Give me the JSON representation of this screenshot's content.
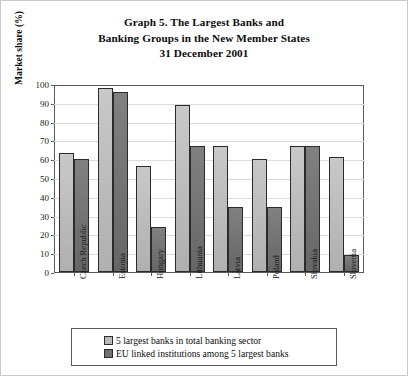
{
  "chart_data": {
    "type": "bar",
    "title": "Graph 5. The Largest Banks and Banking Groups in the New Member States 31 December 2001",
    "title_lines": [
      "Graph 5. The Largest Banks and",
      "Banking Groups in the New Member States",
      "31 December 2001"
    ],
    "xlabel": "",
    "ylabel": "Market share (%)",
    "ylim": [
      0,
      100
    ],
    "ytick_labels": [
      "0",
      "10",
      "20",
      "30",
      "40",
      "50",
      "60",
      "70",
      "80",
      "90",
      "100"
    ],
    "ytick_values": [
      0,
      10,
      20,
      30,
      40,
      50,
      60,
      70,
      80,
      90,
      100
    ],
    "grid": true,
    "legend_position": "bottom",
    "categories": [
      "Czech Republic",
      "Estonia",
      "Hungary",
      "Lithuania",
      "Latvia",
      "Poland",
      "Slovakia",
      "Slovenia"
    ],
    "series": [
      {
        "name": "5 largest banks in total banking sector",
        "color": "#b9b9b9",
        "values": [
          64,
          99,
          57,
          90,
          68,
          61,
          68,
          62
        ]
      },
      {
        "name": "EU linked institutions among 5 largest banks",
        "color": "#6f6f6f",
        "values": [
          61,
          97,
          24,
          68,
          35,
          35,
          68,
          9
        ]
      }
    ]
  },
  "legend": {
    "items": [
      {
        "label": "5 largest banks in total banking sector"
      },
      {
        "label": "EU linked institutions among 5 largest banks"
      }
    ]
  }
}
